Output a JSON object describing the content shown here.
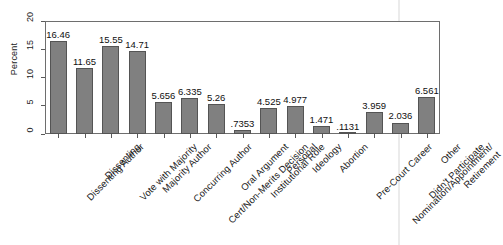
{
  "chart_data": {
    "type": "bar",
    "title": "",
    "subtitle": "",
    "xlabel": "",
    "ylabel": "Percent",
    "ylim": [
      0,
      20
    ],
    "yticks": [
      0,
      5,
      10,
      15,
      20
    ],
    "ytick_labels": [
      "0",
      "5",
      "10",
      "15",
      "20"
    ],
    "grid": false,
    "legend": null,
    "orientation": "vertical",
    "label_rotation_deg": -45,
    "bar_color": "#808080",
    "bar_edge_color": "#545454",
    "categories": [
      "Dissenting Author",
      "Dissenting",
      "Vote with Majority",
      "Majority Author",
      "Concurring Author",
      "Cert/Non-Merits Decision",
      "Oral Argument",
      "Institutional Role",
      "Personal",
      "Ideology",
      "Abortion",
      "Pre-Court Career",
      "Nomination/Appointment/Retirement",
      "Didn't Participate",
      "Other"
    ],
    "category_lines": [
      [
        "Dissenting Author"
      ],
      [
        "Dissenting"
      ],
      [
        "Vote with Majority"
      ],
      [
        "Majority Author"
      ],
      [
        "Concurring Author"
      ],
      [
        "Cert/Non-Merits Decision"
      ],
      [
        "Oral Argument"
      ],
      [
        "Institutional Role"
      ],
      [
        "Personal"
      ],
      [
        "Ideology"
      ],
      [
        "Abortion"
      ],
      [
        "Pre-Court Career"
      ],
      [
        "Nomination/Appointment/",
        "Retirement"
      ],
      [
        "Didn't Participate"
      ],
      [
        "Other"
      ]
    ],
    "values": [
      16.46,
      11.65,
      15.55,
      14.71,
      5.656,
      6.335,
      5.26,
      0.7353,
      4.525,
      4.977,
      1.471,
      0.1131,
      3.959,
      2.036,
      6.561
    ],
    "value_labels": [
      "16.46",
      "11.65",
      "15.55",
      "14.71",
      "5.656",
      "6.335",
      "5.26",
      ".7353",
      "4.525",
      "4.977",
      "1.471",
      ".1131",
      "3.959",
      "2.036",
      "6.561"
    ]
  }
}
